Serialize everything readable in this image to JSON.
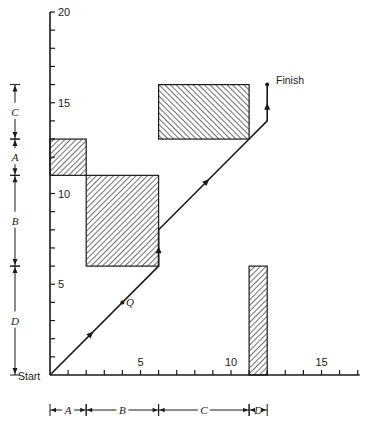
{
  "diagram": {
    "type": "job-shop schedule diagram (two-job geometric method)",
    "origin_label": "Start",
    "finish_label": "Finish",
    "point_label": "Q",
    "x_axis": {
      "range": [
        0,
        17
      ],
      "ticks": [
        1,
        2,
        3,
        4,
        5,
        6,
        7,
        8,
        9,
        10,
        11,
        12,
        13,
        14,
        15,
        16,
        17
      ],
      "tick_labels": [
        {
          "value": 5,
          "label": "5"
        },
        {
          "value": 10,
          "label": "10"
        },
        {
          "value": 15,
          "label": "15"
        }
      ]
    },
    "y_axis": {
      "range": [
        0,
        20
      ],
      "ticks": [
        1,
        2,
        3,
        4,
        5,
        6,
        7,
        8,
        9,
        10,
        11,
        12,
        13,
        14,
        15,
        16,
        17,
        18,
        19,
        20
      ],
      "tick_labels": [
        {
          "value": 5,
          "label": "5"
        },
        {
          "value": 10,
          "label": "10"
        },
        {
          "value": 15,
          "label": "15"
        },
        {
          "value": 20,
          "label": "20"
        }
      ]
    },
    "x_brackets": [
      {
        "label": "A",
        "from": 0,
        "to": 2
      },
      {
        "label": "B",
        "from": 2,
        "to": 6
      },
      {
        "label": "C",
        "from": 6,
        "to": 11
      },
      {
        "label": "D",
        "from": 11,
        "to": 12
      }
    ],
    "y_brackets": [
      {
        "label": "D",
        "from": 0,
        "to": 6
      },
      {
        "label": "B",
        "from": 6,
        "to": 11
      },
      {
        "label": "A",
        "from": 11,
        "to": 13
      },
      {
        "label": "C",
        "from": 13,
        "to": 16
      }
    ],
    "blocked_regions": [
      {
        "machine": "A",
        "x": [
          0,
          2
        ],
        "y": [
          11,
          13
        ],
        "hatch": "backslash"
      },
      {
        "machine": "B",
        "x": [
          2,
          6
        ],
        "y": [
          6,
          11
        ],
        "hatch": "backslash"
      },
      {
        "machine": "C",
        "x": [
          6,
          11
        ],
        "y": [
          13,
          16
        ],
        "hatch": "slash"
      },
      {
        "machine": "D",
        "x": [
          11,
          12
        ],
        "y": [
          0,
          6
        ],
        "hatch": "backslash"
      }
    ],
    "path": [
      [
        0,
        0
      ],
      [
        6,
        6
      ],
      [
        6,
        8
      ],
      [
        11,
        13
      ],
      [
        12,
        14
      ],
      [
        12,
        16
      ]
    ],
    "path_arrows": [
      [
        2.4,
        2.4
      ],
      [
        6,
        7.1
      ],
      [
        8.8,
        10.8
      ],
      [
        12,
        15.0
      ]
    ],
    "point_q": [
      4,
      4
    ]
  }
}
